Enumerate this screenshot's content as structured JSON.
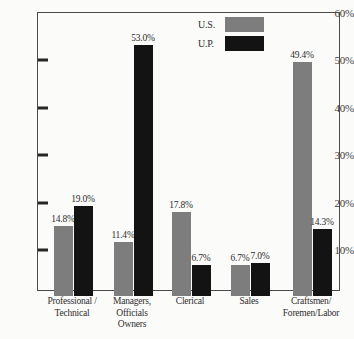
{
  "chart_data": {
    "type": "bar",
    "title": "",
    "xlabel": "",
    "ylabel": "",
    "ylim": [
      0,
      60
    ],
    "grid": false,
    "legend_position": "top-right",
    "categories": [
      "Professional /\nTechnical",
      "Managers,\nOfficials\nOwners",
      "Clerical",
      "Sales",
      "Craftsmen/\nForemen/Labor"
    ],
    "series": [
      {
        "name": "U.S.",
        "color": "#7d7d7d",
        "values": [
          14.8,
          11.4,
          17.8,
          6.7,
          49.4
        ]
      },
      {
        "name": "U.P.",
        "color": "#131313",
        "values": [
          19.0,
          53.0,
          6.7,
          7.0,
          14.3
        ]
      }
    ],
    "value_labels": [
      [
        "14.8%",
        "11.4%",
        "17.8%",
        "6.7%",
        "49.4%"
      ],
      [
        "19.0%",
        "53.0%",
        "6.7%",
        "7.0%",
        "14.3%"
      ]
    ],
    "ytick_labels": [
      "60%",
      "50%",
      "40%",
      "30%",
      "20%",
      "10%"
    ],
    "ytick_values": [
      60,
      50,
      40,
      30,
      20,
      10
    ]
  },
  "legend": {
    "entries": [
      {
        "label": "U.S.",
        "color": "#7d7d7d"
      },
      {
        "label": "U.P.",
        "color": "#131313"
      }
    ]
  },
  "category_lines": [
    [
      "Professional /",
      "Technical"
    ],
    [
      "Managers,",
      "Officials",
      "Owners"
    ],
    [
      "Clerical"
    ],
    [
      "Sales"
    ],
    [
      "Craftsmen/",
      "Foremen/Labor"
    ]
  ],
  "colors": {
    "series_us": "#7d7d7d",
    "series_up": "#131313",
    "background": "#fbfbfa",
    "axis": "#4a4a4a",
    "text": "#2e2e2e"
  }
}
